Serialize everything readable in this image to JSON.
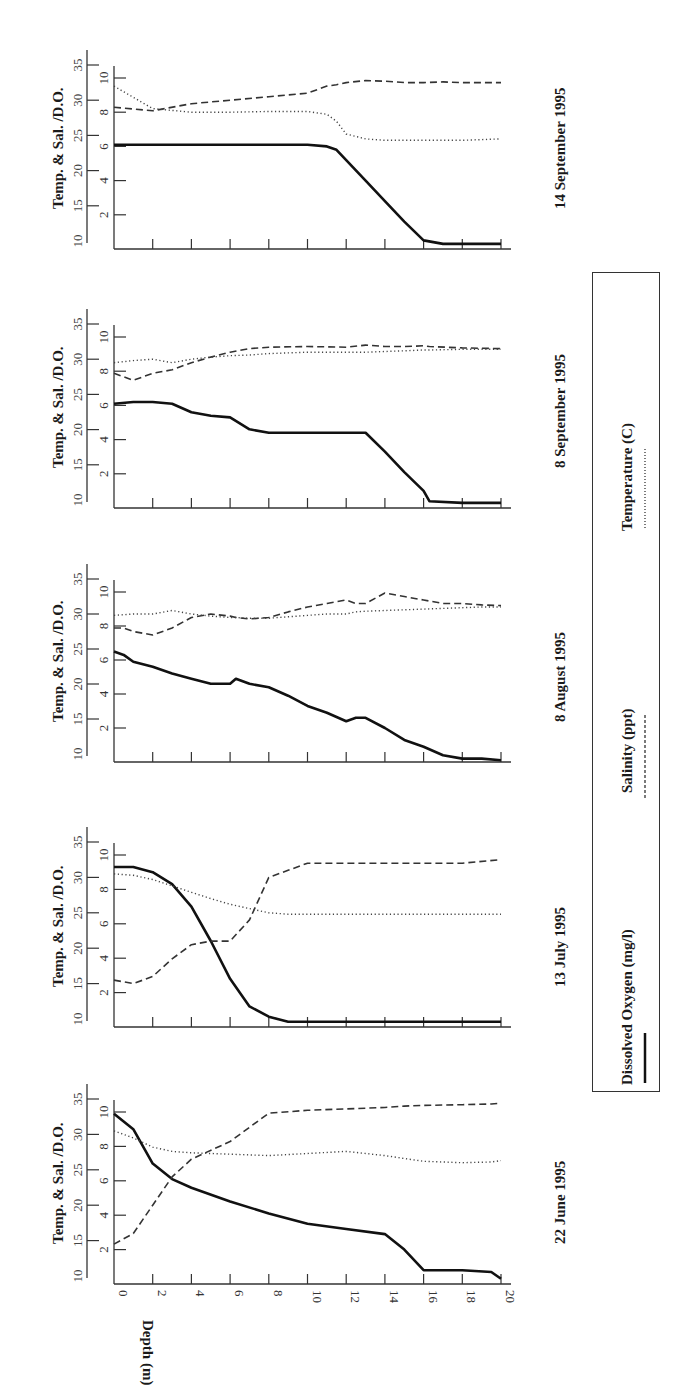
{
  "figure": {
    "orientation": "rotated-90-ccw",
    "depth_axis_label": "Depth (m)",
    "y_axis_label": "Temp. & Sal. /D.O.",
    "legend": [
      {
        "label": "Dissolved Oxygen (mg/l)",
        "style": "solid"
      },
      {
        "label": "Salinity (ppt)",
        "style": "dashed"
      },
      {
        "label": "Temperature (C)",
        "style": "dotted"
      }
    ],
    "panels": [
      {
        "date": "14 September 1995"
      },
      {
        "date": "8 September 1995"
      },
      {
        "date": "8 August 1995"
      },
      {
        "date": "13 July 1995"
      },
      {
        "date": "22 June 1995"
      }
    ]
  },
  "chart_data": [
    {
      "type": "line",
      "title": "22 June 1995",
      "xlabel": "Depth (m)",
      "ylabel": "Temp. & Sal. /D.O.",
      "x_ticks": [
        0,
        2,
        4,
        6,
        8,
        10,
        12,
        14,
        16,
        18,
        20
      ],
      "do_ticks": [
        2,
        4,
        6,
        8,
        10
      ],
      "temp_sal_ticks": [
        10,
        15,
        20,
        25,
        30,
        35
      ],
      "xlim": [
        0,
        20
      ],
      "do_lim": [
        0,
        10
      ],
      "temp_sal_lim": [
        10,
        35
      ],
      "x": [
        0,
        1,
        2,
        3,
        4,
        6,
        8,
        10,
        12,
        14,
        15,
        16,
        18,
        19.5,
        20
      ],
      "series": [
        {
          "name": "Dissolved Oxygen (mg/l)",
          "style": "solid",
          "axis": "do",
          "values": [
            9.9,
            9.0,
            7.0,
            6.1,
            5.6,
            4.8,
            4.1,
            3.5,
            3.2,
            2.9,
            2.0,
            0.8,
            0.8,
            0.7,
            0.3
          ]
        },
        {
          "name": "Salinity (ppt)",
          "style": "dashed",
          "axis": "temp_sal",
          "values": [
            14.5,
            16.0,
            20.0,
            24.0,
            26.5,
            29.0,
            33.0,
            33.4,
            33.6,
            33.8,
            34.0,
            34.1,
            34.2,
            34.3,
            34.4
          ]
        },
        {
          "name": "Temperature (C)",
          "style": "dotted",
          "axis": "temp_sal",
          "values": [
            30.5,
            29.5,
            28.2,
            27.6,
            27.4,
            27.2,
            27.0,
            27.3,
            27.6,
            27.0,
            26.6,
            26.2,
            26.0,
            26.1,
            26.3
          ]
        }
      ]
    },
    {
      "type": "line",
      "title": "13 July 1995",
      "xlabel": "Depth (m)",
      "ylabel": "Temp. & Sal. /D.O.",
      "x_ticks": [
        0,
        2,
        4,
        6,
        8,
        10,
        12,
        14,
        16,
        18,
        20
      ],
      "do_ticks": [
        2,
        4,
        6,
        8,
        10
      ],
      "temp_sal_ticks": [
        10,
        15,
        20,
        25,
        30,
        35
      ],
      "xlim": [
        0,
        20
      ],
      "do_lim": [
        0,
        10
      ],
      "temp_sal_lim": [
        10,
        35
      ],
      "x": [
        0,
        1,
        2,
        3,
        4,
        5,
        6,
        7,
        8,
        9,
        10,
        12,
        14,
        16,
        18,
        20
      ],
      "series": [
        {
          "name": "Dissolved Oxygen (mg/l)",
          "style": "solid",
          "axis": "do",
          "values": [
            9.3,
            9.3,
            9.0,
            8.3,
            7.0,
            5.0,
            2.8,
            1.2,
            0.6,
            0.3,
            0.3,
            0.3,
            0.3,
            0.3,
            0.3,
            0.3
          ]
        },
        {
          "name": "Salinity (ppt)",
          "style": "dashed",
          "axis": "temp_sal",
          "values": [
            15.5,
            15.0,
            16.0,
            18.5,
            20.5,
            21.0,
            21.0,
            24.0,
            30.0,
            31.0,
            32.0,
            32.0,
            32.0,
            32.0,
            32.0,
            32.5
          ]
        },
        {
          "name": "Temperature (C)",
          "style": "dotted",
          "axis": "temp_sal",
          "values": [
            30.5,
            30.3,
            29.7,
            28.8,
            27.9,
            27.0,
            26.2,
            25.6,
            25.0,
            24.8,
            24.8,
            24.8,
            24.8,
            24.8,
            24.8,
            24.8
          ]
        }
      ]
    },
    {
      "type": "line",
      "title": "8 August 1995",
      "xlabel": "Depth (m)",
      "ylabel": "Temp. & Sal. /D.O.",
      "x_ticks": [
        0,
        2,
        4,
        6,
        8,
        10,
        12,
        14,
        16,
        18,
        20
      ],
      "do_ticks": [
        2,
        4,
        6,
        8,
        10
      ],
      "temp_sal_ticks": [
        10,
        15,
        20,
        25,
        30,
        35
      ],
      "xlim": [
        0,
        20
      ],
      "do_lim": [
        0,
        10
      ],
      "temp_sal_lim": [
        10,
        35
      ],
      "x": [
        0,
        0.5,
        1,
        2,
        3,
        4,
        5,
        6,
        6.3,
        7,
        8,
        9,
        10,
        11,
        12,
        12.5,
        13,
        14,
        15,
        16,
        17,
        18,
        19,
        20
      ],
      "series": [
        {
          "name": "Dissolved Oxygen (mg/l)",
          "style": "solid",
          "axis": "do",
          "values": [
            6.5,
            6.3,
            5.9,
            5.6,
            5.2,
            4.9,
            4.6,
            4.6,
            4.9,
            4.6,
            4.4,
            3.9,
            3.3,
            2.9,
            2.4,
            2.6,
            2.6,
            2.0,
            1.3,
            0.9,
            0.4,
            0.2,
            0.2,
            0.1
          ]
        },
        {
          "name": "Salinity (ppt)",
          "style": "dashed",
          "axis": "temp_sal",
          "values": [
            28.0,
            28.0,
            27.5,
            27.0,
            28.0,
            29.5,
            30.0,
            29.7,
            29.5,
            29.3,
            29.5,
            30.3,
            31.0,
            31.5,
            32.0,
            31.5,
            31.5,
            33.0,
            32.5,
            32.0,
            31.5,
            31.5,
            31.3,
            31.2
          ]
        },
        {
          "name": "Temperature (C)",
          "style": "dotted",
          "axis": "temp_sal",
          "values": [
            29.8,
            29.9,
            30.0,
            30.0,
            30.5,
            30.0,
            29.7,
            29.5,
            29.5,
            29.4,
            29.4,
            29.6,
            29.8,
            30.0,
            30.0,
            30.3,
            30.4,
            30.5,
            30.6,
            30.7,
            30.8,
            30.9,
            31.0,
            31.0
          ]
        }
      ]
    },
    {
      "type": "line",
      "title": "8 September 1995",
      "xlabel": "Depth (m)",
      "ylabel": "Temp. & Sal. /D.O.",
      "x_ticks": [
        0,
        2,
        4,
        6,
        8,
        10,
        12,
        14,
        16,
        18,
        20
      ],
      "do_ticks": [
        2,
        4,
        6,
        8,
        10
      ],
      "temp_sal_ticks": [
        10,
        15,
        20,
        25,
        30,
        35
      ],
      "xlim": [
        0,
        20
      ],
      "do_lim": [
        0,
        10
      ],
      "temp_sal_lim": [
        10,
        35
      ],
      "x": [
        0,
        1,
        2,
        3,
        4,
        5,
        6,
        7,
        8,
        10,
        12,
        13,
        14,
        15,
        16,
        16.3,
        18,
        20
      ],
      "series": [
        {
          "name": "Dissolved Oxygen (mg/l)",
          "style": "solid",
          "axis": "do",
          "values": [
            6.1,
            6.2,
            6.2,
            6.1,
            5.6,
            5.4,
            5.3,
            4.6,
            4.4,
            4.4,
            4.4,
            4.4,
            3.3,
            2.1,
            1.0,
            0.4,
            0.3,
            0.3
          ]
        },
        {
          "name": "Salinity (ppt)",
          "style": "dashed",
          "axis": "temp_sal",
          "values": [
            28.0,
            27.0,
            28.0,
            28.5,
            29.5,
            30.3,
            31.0,
            31.5,
            31.7,
            31.8,
            31.7,
            32.0,
            31.8,
            31.8,
            31.9,
            31.8,
            31.6,
            31.5
          ]
        },
        {
          "name": "Temperature (C)",
          "style": "dotted",
          "axis": "temp_sal",
          "values": [
            29.5,
            29.8,
            30.0,
            29.5,
            30.0,
            30.3,
            30.5,
            30.6,
            30.8,
            31.0,
            31.0,
            31.0,
            31.1,
            31.2,
            31.3,
            31.3,
            31.4,
            31.4
          ]
        }
      ]
    },
    {
      "type": "line",
      "title": "14 September 1995",
      "xlabel": "Depth (m)",
      "ylabel": "Temp. & Sal. /D.O.",
      "x_ticks": [
        0,
        2,
        4,
        6,
        8,
        10,
        12,
        14,
        16,
        18,
        20
      ],
      "do_ticks": [
        2,
        4,
        6,
        8,
        10
      ],
      "temp_sal_ticks": [
        10,
        15,
        20,
        25,
        30,
        35
      ],
      "xlim": [
        0,
        20
      ],
      "do_lim": [
        0,
        10
      ],
      "temp_sal_lim": [
        10,
        35
      ],
      "x": [
        0,
        2,
        4,
        6,
        8,
        10,
        11,
        11.5,
        12,
        13,
        14,
        15,
        16,
        17,
        18,
        20
      ],
      "series": [
        {
          "name": "Dissolved Oxygen (mg/l)",
          "style": "solid",
          "axis": "do",
          "values": [
            6.1,
            6.1,
            6.1,
            6.1,
            6.1,
            6.1,
            6.0,
            5.8,
            5.2,
            4.0,
            2.8,
            1.6,
            0.5,
            0.3,
            0.3,
            0.3
          ]
        },
        {
          "name": "Salinity (ppt)",
          "style": "dashed",
          "axis": "temp_sal",
          "values": [
            29.0,
            28.5,
            29.5,
            30.0,
            30.5,
            31.0,
            32.0,
            32.2,
            32.5,
            32.8,
            32.7,
            32.5,
            32.5,
            32.6,
            32.5,
            32.5
          ]
        },
        {
          "name": "Temperature (C)",
          "style": "dotted",
          "axis": "temp_sal",
          "values": [
            32.0,
            28.8,
            28.3,
            28.3,
            28.4,
            28.4,
            28.0,
            27.0,
            25.2,
            24.5,
            24.3,
            24.3,
            24.3,
            24.3,
            24.3,
            24.5
          ]
        }
      ]
    }
  ]
}
